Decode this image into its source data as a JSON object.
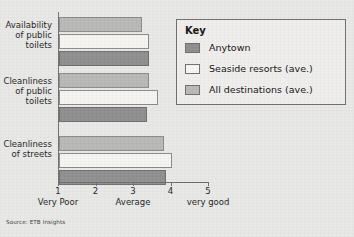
{
  "chart_data": {
    "type": "bar",
    "orientation": "horizontal",
    "title": "",
    "xlabel": "",
    "ylabel": "",
    "xlim": [
      1,
      5
    ],
    "grid": false,
    "legend_position": "top-right",
    "categories": [
      "Availability of public toilets",
      "Cleanliness of public toilets",
      "Cleanliness of streets"
    ],
    "category_lines": [
      [
        "Availability",
        "of public",
        "toilets"
      ],
      [
        "Cleanliness",
        "of public",
        "toilets"
      ],
      [
        "Cleanliness",
        "of streets"
      ]
    ],
    "series": [
      {
        "name": "Anytown",
        "color": "#8e8e8e",
        "values": [
          3.4,
          3.35,
          3.85
        ]
      },
      {
        "name": "Seaside resorts (ave.)",
        "color": "#f5f4f0",
        "values": [
          3.4,
          3.65,
          4.0
        ]
      },
      {
        "name": "All destinations (ave.)",
        "color": "#b8b8b6",
        "values": [
          3.2,
          3.4,
          3.8
        ]
      }
    ],
    "xticks": [
      {
        "value": 1,
        "label": "1",
        "caption": "Very Poor"
      },
      {
        "value": 2,
        "label": "2",
        "caption": ""
      },
      {
        "value": 3,
        "label": "3",
        "caption": "Average"
      },
      {
        "value": 4,
        "label": "4",
        "caption": ""
      },
      {
        "value": 5,
        "label": "5",
        "caption": "very good"
      }
    ]
  },
  "legend": {
    "title": "Key",
    "items": [
      {
        "label": "Anytown",
        "swatch": "anytown"
      },
      {
        "label": "Seaside resorts (ave.)",
        "swatch": "seaside"
      },
      {
        "label": "All destinations (ave.)",
        "swatch": "all"
      }
    ]
  },
  "source": {
    "text": "Source: ETB Insights"
  },
  "colors": {
    "background": "#e8e8e6",
    "axis": "#6f6f6f",
    "anytown": "#8e8e8e",
    "seaside": "#f5f4f0",
    "all_destinations": "#b8b8b6",
    "text": "#1d1d1d"
  }
}
